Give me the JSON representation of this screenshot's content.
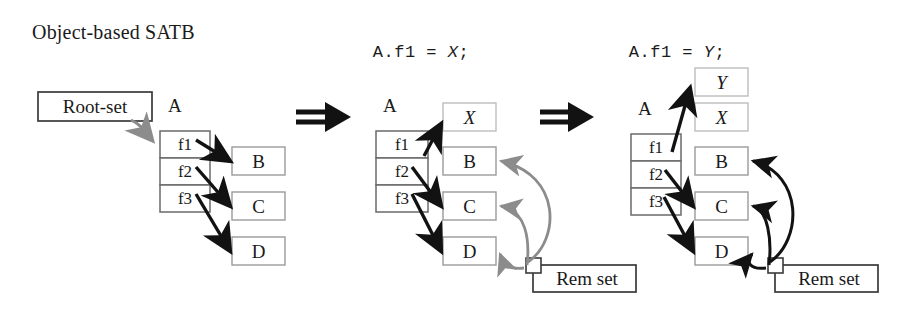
{
  "canvas": {
    "width": 920,
    "height": 318,
    "background": "#ffffff"
  },
  "colors": {
    "ink": "#1a1a1a",
    "box_border_dark": "#3a3a3a",
    "box_border_light": "#a8a8a8",
    "arrow_black": "#121212",
    "arrow_gray": "#8c8c8c",
    "background": "#ffffff"
  },
  "title": "Object-based SATB",
  "code_steps": [
    {
      "id": "step1",
      "text": "A.f1 = X;",
      "prefix": "A.f1 = ",
      "variable": "X",
      "suffix": ";"
    },
    {
      "id": "step2",
      "text": "A.f1 = Y;",
      "prefix": "A.f1 = ",
      "variable": "Y",
      "suffix": ";"
    }
  ],
  "transition_symbol": "double-right-arrow",
  "panels": [
    {
      "id": "panel-initial",
      "object_label": "A",
      "fields": [
        "f1",
        "f2",
        "f3"
      ],
      "root_set_label": "Root-set",
      "heap_objects": [
        "B",
        "C",
        "D"
      ],
      "new_objects": [],
      "rem_set_label": null,
      "field_targets": [
        {
          "field": "f1",
          "target": "B",
          "color": "black"
        },
        {
          "field": "f2",
          "target": "C",
          "color": "black"
        },
        {
          "field": "f3",
          "target": "D",
          "color": "black"
        }
      ],
      "rem_set_targets": []
    },
    {
      "id": "panel-after-x",
      "object_label": "A",
      "fields": [
        "f1",
        "f2",
        "f3"
      ],
      "root_set_label": null,
      "heap_objects": [
        "B",
        "C",
        "D"
      ],
      "new_objects": [
        "X"
      ],
      "rem_set_label": "Rem set",
      "field_targets": [
        {
          "field": "f1",
          "target": "X",
          "color": "black"
        },
        {
          "field": "f2",
          "target": "C",
          "color": "black"
        },
        {
          "field": "f3",
          "target": "D",
          "color": "black"
        }
      ],
      "rem_set_targets": [
        {
          "target": "B",
          "color": "gray"
        },
        {
          "target": "C",
          "color": "gray"
        },
        {
          "target": "D",
          "color": "gray"
        }
      ]
    },
    {
      "id": "panel-after-y",
      "object_label": "A",
      "fields": [
        "f1",
        "f2",
        "f3"
      ],
      "root_set_label": null,
      "heap_objects": [
        "B",
        "C",
        "D"
      ],
      "new_objects": [
        "Y",
        "X"
      ],
      "rem_set_label": "Rem set",
      "field_targets": [
        {
          "field": "f1",
          "target": "Y",
          "color": "black"
        },
        {
          "field": "f2",
          "target": "C",
          "color": "black"
        },
        {
          "field": "f3",
          "target": "D",
          "color": "black"
        }
      ],
      "rem_set_targets": [
        {
          "target": "B",
          "color": "black"
        },
        {
          "target": "C",
          "color": "black"
        },
        {
          "target": "D",
          "color": "black"
        }
      ]
    }
  ]
}
